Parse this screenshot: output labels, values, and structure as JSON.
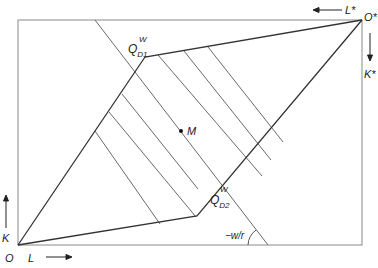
{
  "diagram": {
    "type": "edgeworth-box",
    "colors": {
      "box": "#8a8a8a",
      "curve": "#333333",
      "hatch": "#6a6a6a",
      "text": "#222222"
    },
    "labels": {
      "origin": "O",
      "origin_star": "O*",
      "labor_axis": "L",
      "capital_axis": "K",
      "labor_axis_star": "L*",
      "capital_axis_star": "K*",
      "qd1_main": "Q",
      "qd1_sup": "W",
      "qd1_sub": "D1",
      "qd2_main": "Q",
      "qd2_sup": "W",
      "qd2_sub": "D2",
      "point_m": "M",
      "slope": "−w/r"
    },
    "points": {
      "O": [
        18,
        245
      ],
      "O_star": [
        362,
        20
      ],
      "QD1": [
        145,
        57
      ],
      "QD2": [
        197,
        216
      ],
      "M": [
        181,
        131
      ]
    }
  }
}
